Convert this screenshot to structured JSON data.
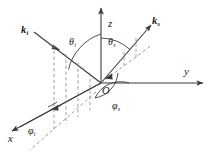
{
  "figure": {
    "background_color": "#ffffff",
    "line_color": "#3c3c3c",
    "dash_color": "#8c8c8c",
    "axes": [
      {
        "name": "z",
        "label": "z",
        "direction": "up"
      },
      {
        "name": "y",
        "label": "y",
        "direction": "right"
      },
      {
        "name": "x",
        "label": "x",
        "direction": "lower-left"
      }
    ],
    "origin": {
      "label": "O"
    },
    "vectors": [
      {
        "name": "incident-wave-vector",
        "label": "k",
        "subscript": "i",
        "direction": "from-upper-left-to-origin"
      },
      {
        "name": "scattered-wave-vector",
        "label": "k",
        "subscript": "s",
        "direction": "from-origin-to-upper-right"
      }
    ],
    "angles": [
      {
        "name": "incident-polar-angle",
        "label": "θ",
        "subscript": "i"
      },
      {
        "name": "scattered-polar-angle",
        "label": "θ",
        "subscript": "s"
      },
      {
        "name": "incident-azimuthal-angle",
        "label": "φ",
        "subscript": "i"
      },
      {
        "name": "scattered-azimuthal-angle",
        "label": "φ",
        "subscript": "s"
      }
    ]
  }
}
